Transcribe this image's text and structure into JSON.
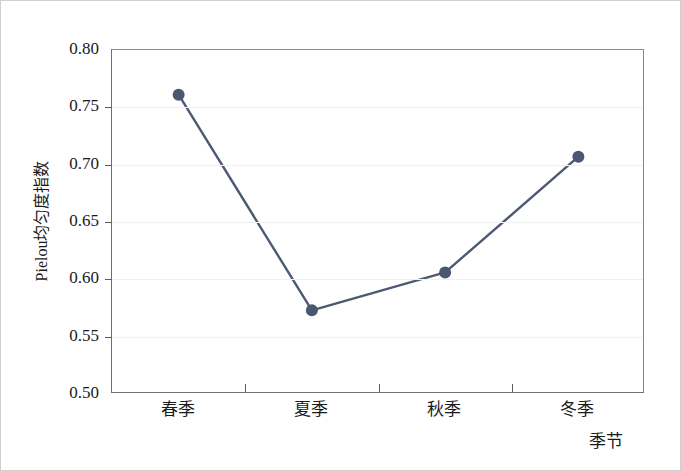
{
  "chart_data": {
    "type": "line",
    "title": "",
    "subtitle": "",
    "categories": [
      "春季",
      "夏季",
      "秋季",
      "冬季"
    ],
    "values": [
      0.761,
      0.573,
      0.606,
      0.707
    ],
    "series": [
      {
        "name": "Pielou均匀度指数",
        "values": [
          0.761,
          0.573,
          0.606,
          0.707
        ]
      }
    ],
    "xlabel": "季节",
    "ylabel": "Pielou均匀度指数",
    "ylim": [
      0.5,
      0.8
    ],
    "ytick_labels": [
      "0.80",
      "0.75",
      "0.70",
      "0.65",
      "0.60",
      "0.55",
      "0.50"
    ],
    "ytick_values": [
      0.8,
      0.75,
      0.7,
      0.65,
      0.6,
      0.55,
      0.5
    ],
    "grid": true,
    "legend": "none",
    "marker": "circle",
    "line_color": "#4d5a72",
    "marker_color": "#4a5771",
    "grid_color": "#f1f1f3",
    "axis_color": "#6e6e6e",
    "background": "#ffffff"
  },
  "axes": {
    "y_title": "Pielou均匀度指数",
    "x_title": "季节"
  }
}
